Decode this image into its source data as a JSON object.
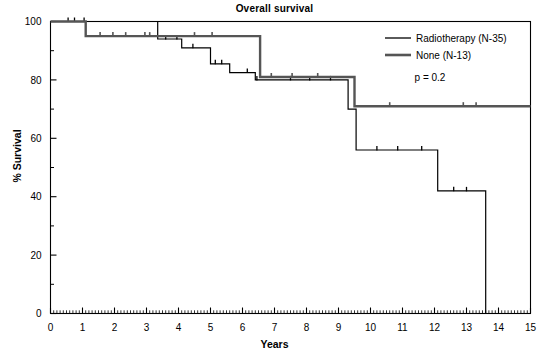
{
  "chart_data": {
    "type": "line",
    "title": "Overall survival",
    "xlabel": "Years",
    "ylabel": "% Survival",
    "xlim": [
      0,
      15
    ],
    "ylim": [
      0,
      100
    ],
    "xticks": [
      "0",
      "1",
      "2",
      "3",
      "4",
      "5",
      "6",
      "7",
      "8",
      "9",
      "10",
      "11",
      "12",
      "13",
      "14",
      "15"
    ],
    "yticks": [
      "0",
      "20",
      "40",
      "60",
      "80",
      "100"
    ],
    "grid": false,
    "legend_position": "top-right",
    "annotations": [
      "p = 0.2"
    ],
    "series": [
      {
        "name": "Radiotherapy (N-35)",
        "color": "#000000",
        "style": "thin-step",
        "points": [
          [
            0.0,
            100
          ],
          [
            3.35,
            100
          ],
          [
            3.35,
            94
          ],
          [
            4.1,
            94
          ],
          [
            4.1,
            91
          ],
          [
            5.0,
            91
          ],
          [
            5.0,
            85.5
          ],
          [
            5.6,
            85.5
          ],
          [
            5.6,
            82.5
          ],
          [
            6.4,
            82.5
          ],
          [
            6.4,
            80
          ],
          [
            9.3,
            80
          ],
          [
            9.3,
            70
          ],
          [
            9.55,
            70
          ],
          [
            9.55,
            56
          ],
          [
            12.1,
            56
          ],
          [
            12.1,
            42
          ],
          [
            13.6,
            42
          ],
          [
            13.6,
            0
          ]
        ],
        "censor_marks": [
          0.55,
          0.75,
          1.05,
          3.6,
          3.95,
          4.45,
          5.15,
          5.35,
          6.15,
          6.45,
          7.5,
          8.1,
          8.75,
          10.2,
          10.85,
          11.6,
          12.6,
          13.0
        ]
      },
      {
        "name": "None (N-13)",
        "color": "#555555",
        "style": "thick-step",
        "points": [
          [
            0.0,
            100
          ],
          [
            1.1,
            100
          ],
          [
            1.1,
            95
          ],
          [
            6.55,
            95
          ],
          [
            6.55,
            81
          ],
          [
            9.5,
            81
          ],
          [
            9.5,
            71
          ],
          [
            15.0,
            71
          ]
        ],
        "censor_marks": [
          1.55,
          1.95,
          2.35,
          2.95,
          3.1,
          4.5,
          5.05,
          6.9,
          7.55,
          8.35,
          10.6,
          12.9,
          13.3
        ]
      }
    ]
  },
  "legend": {
    "entries": [
      {
        "label": "Radiotherapy (N-35)"
      },
      {
        "label": "None (N-13)"
      }
    ],
    "pvalue": "p = 0.2"
  }
}
